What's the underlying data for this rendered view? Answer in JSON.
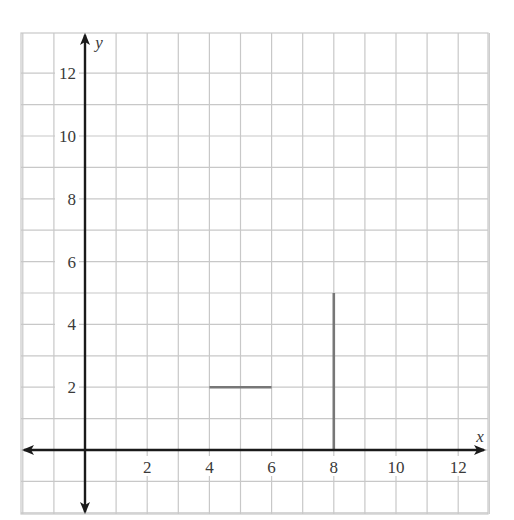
{
  "chart_data": {
    "type": "line",
    "title": "",
    "xlabel": "x",
    "ylabel": "y",
    "xlim": [
      -2,
      13
    ],
    "ylim": [
      -2,
      12.7
    ],
    "grid": true,
    "grid_step": 1,
    "x_ticks": [
      2,
      4,
      6,
      8,
      10,
      12
    ],
    "y_ticks": [
      2,
      4,
      6,
      8,
      10,
      12
    ],
    "x_tick_labels": [
      "2",
      "4",
      "6",
      "8",
      "10",
      "12"
    ],
    "y_tick_labels": [
      "2",
      "4",
      "6",
      "8",
      "10",
      "12"
    ],
    "series": [
      {
        "name": "horizontal segment",
        "points": [
          [
            4,
            2
          ],
          [
            6,
            2
          ]
        ]
      },
      {
        "name": "vertical segment",
        "points": [
          [
            8,
            0
          ],
          [
            8,
            5
          ]
        ]
      }
    ],
    "legend": null
  },
  "colors": {
    "grid": "#c8c8c8",
    "axis": "#1a1a1a",
    "segment": "#777777",
    "text": "#3a3a3a"
  },
  "layout": {
    "x0_px": 85,
    "y0_px": 450,
    "unit_x_px": 31.1,
    "unit_y_px": 31.4,
    "grid_left_px": 21,
    "grid_right_px": 488,
    "grid_top_px": 33,
    "grid_bottom_px": 514
  }
}
